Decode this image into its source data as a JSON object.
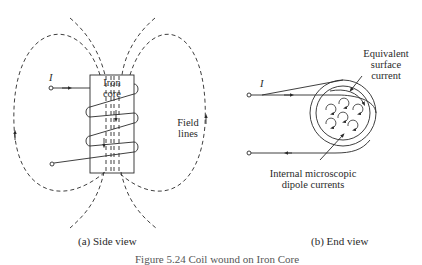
{
  "figure": {
    "side_view": {
      "current_label": "I",
      "core_label_line1": "Iron",
      "core_label_line2": "core",
      "field_label_line1": "Field",
      "field_label_line2": "lines",
      "caption": "(a) Side view"
    },
    "end_view": {
      "current_label": "I",
      "surface_label_line1": "Equivalent",
      "surface_label_line2": "surface",
      "surface_label_line3": "current",
      "dipole_label_line1": "Internal microscopic",
      "dipole_label_line2": "dipole currents",
      "caption": "(b) End view"
    },
    "figure_caption_partial": "Figure 5.24  Coil wound on Iron Core",
    "colors": {
      "ink": "#2a2a2a",
      "background": "#ffffff"
    }
  }
}
